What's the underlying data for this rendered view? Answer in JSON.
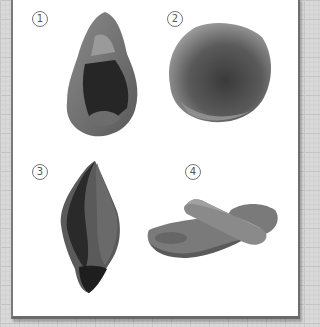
{
  "figure": {
    "items": [
      {
        "label": "1",
        "description": "hand axe, pear-shaped chipped stone"
      },
      {
        "label": "2",
        "description": "round hammer stone"
      },
      {
        "label": "3",
        "description": "pointed chipped stone blade"
      },
      {
        "label": "4",
        "description": "grinding slab with roller stone"
      }
    ]
  }
}
